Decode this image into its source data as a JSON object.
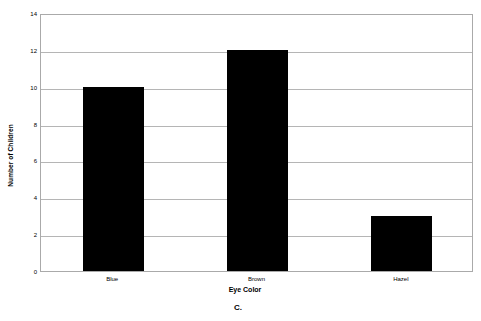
{
  "chart_data": {
    "type": "bar",
    "title": "",
    "categories": [
      "Blue",
      "Brown",
      "Hazel"
    ],
    "values": [
      10,
      12,
      3
    ],
    "xlabel": "Eye Color",
    "ylabel": "Number of Children",
    "ylim": [
      0,
      14
    ],
    "ytick_step": 2,
    "yticks": [
      14,
      12,
      10,
      8,
      6,
      4,
      2,
      0
    ],
    "grid": true,
    "legend": false,
    "bar_color": "#000000",
    "grid_color": "#b5b5b5",
    "frame_color": "#aaaaaa",
    "background": "#ffffff"
  },
  "caption": {
    "text": "C."
  }
}
